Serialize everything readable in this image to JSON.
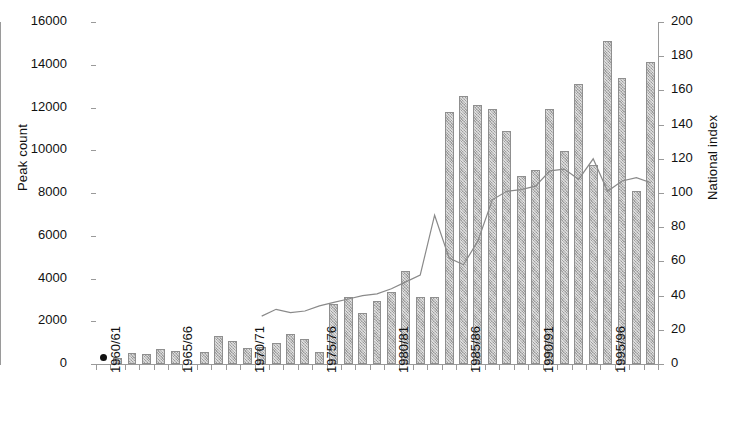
{
  "chart_data": {
    "type": "bar",
    "title": "",
    "subtitle": "",
    "xlabel": "",
    "ylabel": "Peak count",
    "y2label": "National index",
    "ylim": [
      0,
      16000
    ],
    "ytick_step": 2000,
    "y2lim": [
      0,
      200
    ],
    "y2tick_step": 20,
    "grid": false,
    "legend": null,
    "yticks": [
      "0",
      "2000",
      "4000",
      "6000",
      "8000",
      "10000",
      "12000",
      "14000",
      "16000"
    ],
    "y2ticks": [
      "0",
      "20",
      "40",
      "60",
      "80",
      "100",
      "120",
      "140",
      "160",
      "180",
      "200"
    ],
    "xtick_labels": [
      "1960/61",
      "1965/66",
      "1970/71",
      "1975/76",
      "1980/81",
      "1985/86",
      "1990/91",
      "1995/96"
    ],
    "xtick_indices": [
      0,
      5,
      10,
      15,
      20,
      25,
      30,
      35
    ],
    "categories": [
      "1960/61",
      "1961/62",
      "1962/63",
      "1963/64",
      "1964/65",
      "1965/66",
      "1966/67",
      "1967/68",
      "1968/69",
      "1969/70",
      "1970/71",
      "1971/72",
      "1972/73",
      "1973/74",
      "1974/75",
      "1975/76",
      "1976/77",
      "1977/78",
      "1978/79",
      "1979/80",
      "1980/81",
      "1981/82",
      "1982/83",
      "1983/84",
      "1984/85",
      "1985/86",
      "1986/87",
      "1987/88",
      "1988/89",
      "1989/90",
      "1990/91",
      "1991/92",
      "1992/93",
      "1993/94",
      "1994/95",
      "1995/96",
      "1996/97",
      "1997/98",
      "1998/99"
    ],
    "series": [
      {
        "name": "Peak count",
        "type": "bar",
        "axis": "left",
        "color": "#b9b9b9",
        "values": [
          null,
          300,
          500,
          450,
          700,
          600,
          null,
          550,
          1300,
          1100,
          750,
          800,
          1000,
          1400,
          1150,
          550,
          2800,
          3150,
          2400,
          2950,
          3350,
          4350,
          3150,
          3150,
          11800,
          12550,
          12100,
          11950,
          10900,
          8800,
          9100,
          11950,
          9950,
          13100,
          9300,
          15100,
          13400,
          8100,
          14150
        ]
      },
      {
        "name": "National index",
        "type": "line",
        "axis": "right",
        "color": "#8a8a8a",
        "start_index": 11,
        "values": [
          null,
          null,
          null,
          null,
          null,
          null,
          null,
          null,
          null,
          null,
          null,
          28,
          32,
          30,
          31,
          34,
          36,
          38,
          40,
          41,
          44,
          48,
          52,
          87,
          62,
          58,
          72,
          96,
          101,
          102,
          104,
          113,
          114,
          108,
          120,
          101,
          107,
          109,
          106
        ]
      }
    ],
    "extra_marker": {
      "name": "first-year-marker",
      "index": 0,
      "value": 300,
      "style": "filled-circle",
      "color": "#111111"
    }
  }
}
